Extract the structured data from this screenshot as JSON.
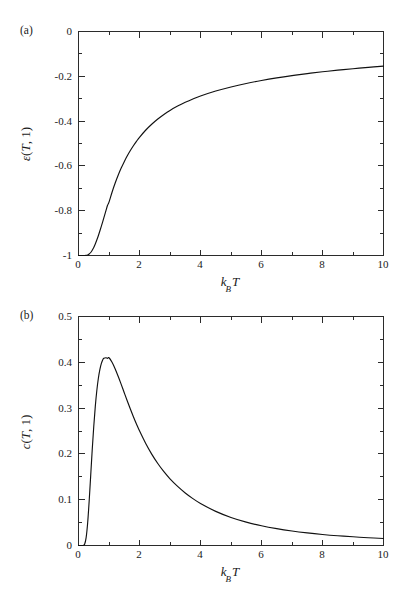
{
  "figure": {
    "panel_a_label": "(a)",
    "panel_b_label": "(b)"
  },
  "chart_data": [
    {
      "id": "panel-a",
      "type": "line",
      "title": "",
      "panel_label": "(a)",
      "xlabel": "k_B T",
      "xlabel_parts": {
        "k": "k",
        "sub": "B",
        "T": "T"
      },
      "ylabel": "ε(T, 1)",
      "ylabel_parts": {
        "symbol": "ε",
        "open": "(",
        "var": "T",
        "comma": ", ",
        "arg": "1",
        "close": ")"
      },
      "xlim": [
        0,
        10
      ],
      "ylim": [
        -1,
        0
      ],
      "grid": false,
      "legend": "none",
      "xticks": [
        0,
        2,
        4,
        6,
        8,
        10
      ],
      "xtick_labels": [
        "0",
        "2",
        "4",
        "6",
        "8",
        "10"
      ],
      "xminor_ticks": [
        1,
        3,
        5,
        7,
        9
      ],
      "yticks": [
        0,
        -0.2,
        -0.4,
        -0.6,
        -0.8,
        -1
      ],
      "ytick_labels": [
        "0",
        "-0.2",
        "-0.4",
        "-0.6",
        "-0.8",
        "-1"
      ],
      "yminor_ticks": [
        -0.1,
        -0.3,
        -0.5,
        -0.7,
        -0.9
      ],
      "series": [
        {
          "name": "epsilon(T,1)",
          "color": "#111111",
          "x": [
            0.0,
            0.05,
            0.1,
            0.15,
            0.2,
            0.25,
            0.3,
            0.35,
            0.4,
            0.45,
            0.5,
            0.55,
            0.6,
            0.65,
            0.7,
            0.75,
            0.8,
            0.85,
            0.9,
            0.95,
            1.0,
            1.1,
            1.2,
            1.3,
            1.4,
            1.5,
            1.6,
            1.7,
            1.8,
            1.9,
            2.0,
            2.2,
            2.4,
            2.6,
            2.8,
            3.0,
            3.25,
            3.5,
            3.75,
            4.0,
            4.5,
            5.0,
            5.5,
            6.0,
            6.5,
            7.0,
            7.5,
            8.0,
            8.5,
            9.0,
            9.5,
            10.0
          ],
          "y": [
            -1.0,
            -1.0,
            -1.0,
            -1.0,
            -1.0,
            -0.9993,
            -0.9975,
            -0.9934,
            -0.9866,
            -0.9768,
            -0.964,
            -0.9488,
            -0.9311,
            -0.9117,
            -0.8908,
            -0.8688,
            -0.8462,
            -0.8231,
            -0.7999,
            -0.7767,
            -0.7616,
            -0.7174,
            -0.6777,
            -0.6419,
            -0.6098,
            -0.581,
            -0.5549,
            -0.5314,
            -0.51,
            -0.4904,
            -0.4724,
            -0.4409,
            -0.414,
            -0.3906,
            -0.3702,
            -0.3522,
            -0.3331,
            -0.3163,
            -0.3014,
            -0.2882,
            -0.2659,
            -0.2475,
            -0.2319,
            -0.2186,
            -0.207,
            -0.1968,
            -0.1878,
            -0.1798,
            -0.1726,
            -0.1661,
            -0.1601,
            -0.1548
          ]
        }
      ]
    },
    {
      "id": "panel-b",
      "type": "line",
      "title": "",
      "panel_label": "(b)",
      "xlabel": "k_B T",
      "xlabel_parts": {
        "k": "k",
        "sub": "B",
        "T": "T"
      },
      "ylabel": "c(T, 1)",
      "ylabel_parts": {
        "symbol": "c",
        "open": "(",
        "var": "T",
        "comma": ", ",
        "arg": "1",
        "close": ")"
      },
      "xlim": [
        0,
        10
      ],
      "ylim": [
        0,
        0.5
      ],
      "grid": false,
      "legend": "none",
      "xticks": [
        0,
        2,
        4,
        6,
        8,
        10
      ],
      "xtick_labels": [
        "0",
        "2",
        "4",
        "6",
        "8",
        "10"
      ],
      "xminor_ticks": [
        1,
        3,
        5,
        7,
        9
      ],
      "yticks": [
        0,
        0.1,
        0.2,
        0.3,
        0.4,
        0.5
      ],
      "ytick_labels": [
        "0",
        "0.1",
        "0.2",
        "0.3",
        "0.4",
        "0.5"
      ],
      "yminor_ticks": [
        0.05,
        0.15,
        0.25,
        0.35,
        0.45
      ],
      "peak": {
        "x": 0.83,
        "y": 0.439
      },
      "series": [
        {
          "name": "c(T,1)",
          "color": "#111111",
          "x": [
            0.0,
            0.05,
            0.1,
            0.15,
            0.2,
            0.25,
            0.3,
            0.35,
            0.4,
            0.45,
            0.5,
            0.55,
            0.6,
            0.65,
            0.7,
            0.75,
            0.8,
            0.83,
            0.9,
            0.95,
            1.0,
            1.1,
            1.2,
            1.3,
            1.4,
            1.5,
            1.6,
            1.7,
            1.8,
            1.9,
            2.0,
            2.2,
            2.4,
            2.6,
            2.8,
            3.0,
            3.25,
            3.5,
            3.75,
            4.0,
            4.5,
            5.0,
            5.5,
            6.0,
            6.5,
            7.0,
            7.5,
            8.0,
            8.5,
            9.0,
            9.5,
            10.0
          ],
          "y": [
            0.0,
            0.0,
            0.0,
            0.0001,
            0.0027,
            0.0171,
            0.0492,
            0.0972,
            0.153,
            0.209,
            0.26,
            0.3033,
            0.338,
            0.3646,
            0.384,
            0.3975,
            0.406,
            0.4086,
            0.41,
            0.4085,
            0.41,
            0.4,
            0.386,
            0.3695,
            0.3518,
            0.3336,
            0.3155,
            0.298,
            0.2812,
            0.2653,
            0.2503,
            0.2232,
            0.1996,
            0.179,
            0.1611,
            0.1455,
            0.129,
            0.1147,
            0.1024,
            0.0918,
            0.0745,
            0.0612,
            0.051,
            0.043,
            0.0367,
            0.0316,
            0.0275,
            0.0241,
            0.0213,
            0.019,
            0.017,
            0.0153
          ]
        }
      ]
    }
  ]
}
